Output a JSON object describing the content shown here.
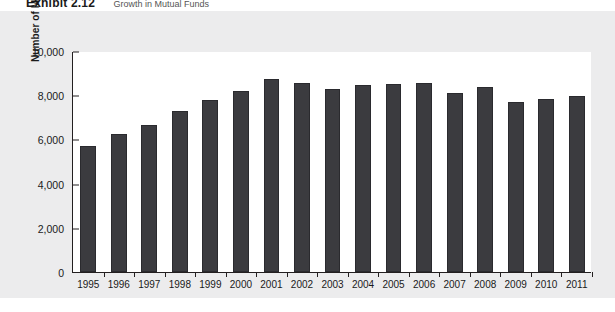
{
  "exhibit": {
    "label": "Exhibit 2.12",
    "title": "Growth in Mutual Funds"
  },
  "chart_data": {
    "type": "bar",
    "title": "Growth in Mutual Funds",
    "xlabel": "Year",
    "ylabel": "Number of Mutual Funds",
    "categories": [
      "1995",
      "1996",
      "1997",
      "1998",
      "1999",
      "2000",
      "2001",
      "2002",
      "2003",
      "2004",
      "2005",
      "2006",
      "2007",
      "2008",
      "2009",
      "2010",
      "2011"
    ],
    "values": [
      5700,
      6250,
      6650,
      7300,
      7800,
      8200,
      8750,
      8550,
      8300,
      8450,
      8500,
      8550,
      8100,
      8350,
      7700,
      7850,
      7950
    ],
    "ylim": [
      0,
      10000
    ],
    "yticks": [
      0,
      2000,
      4000,
      6000,
      8000,
      10000
    ],
    "ytick_labels": [
      "0",
      "2,000",
      "4,000",
      "6,000",
      "8,000",
      "10,000"
    ],
    "grid": false,
    "legend": null,
    "bar_color": "#3b3b3f",
    "panel_background": "#ececed",
    "plot_background": "#ffffff",
    "axis_color": "#231f20"
  }
}
